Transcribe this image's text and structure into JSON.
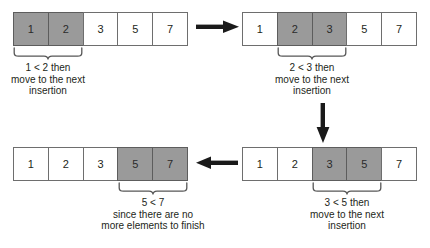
{
  "diagram": {
    "colors": {
      "highlight_fill": "#9a9a9a",
      "cell_fill": "#ffffff",
      "border": "#6e6e6e",
      "text": "#231f20",
      "arrow": "#1a1a1a"
    },
    "steps": [
      {
        "id": "step-1",
        "cells": [
          {
            "value": "1",
            "highlighted": true
          },
          {
            "value": "2",
            "highlighted": true
          },
          {
            "value": "3",
            "highlighted": false
          },
          {
            "value": "5",
            "highlighted": false
          },
          {
            "value": "7",
            "highlighted": false
          }
        ],
        "brace_start_index": 0,
        "brace_end_index": 1,
        "caption": [
          "1 < 2 then",
          "move to the next",
          "insertion"
        ]
      },
      {
        "id": "step-2",
        "cells": [
          {
            "value": "1",
            "highlighted": false
          },
          {
            "value": "2",
            "highlighted": true
          },
          {
            "value": "3",
            "highlighted": true
          },
          {
            "value": "5",
            "highlighted": false
          },
          {
            "value": "7",
            "highlighted": false
          }
        ],
        "brace_start_index": 1,
        "brace_end_index": 2,
        "caption": [
          "2 < 3 then",
          "move to the next",
          "insertion"
        ]
      },
      {
        "id": "step-3",
        "cells": [
          {
            "value": "1",
            "highlighted": false
          },
          {
            "value": "2",
            "highlighted": false
          },
          {
            "value": "3",
            "highlighted": true
          },
          {
            "value": "5",
            "highlighted": true
          },
          {
            "value": "7",
            "highlighted": false
          }
        ],
        "brace_start_index": 2,
        "brace_end_index": 3,
        "caption": [
          "3 < 5 then",
          "move to the next",
          "insertion"
        ]
      },
      {
        "id": "step-4",
        "cells": [
          {
            "value": "1",
            "highlighted": false
          },
          {
            "value": "2",
            "highlighted": false
          },
          {
            "value": "3",
            "highlighted": false
          },
          {
            "value": "5",
            "highlighted": true
          },
          {
            "value": "7",
            "highlighted": true
          }
        ],
        "brace_start_index": 3,
        "brace_end_index": 4,
        "caption": [
          "5 < 7",
          "since there are no",
          "more elements to finish"
        ]
      }
    ],
    "arrows": [
      {
        "id": "arrow-step1-to-step2",
        "direction": "right"
      },
      {
        "id": "arrow-step2-to-step3",
        "direction": "down"
      },
      {
        "id": "arrow-step3-to-step4",
        "direction": "left"
      }
    ]
  },
  "step1": {
    "c0": "1",
    "c1": "2",
    "c2": "3",
    "c3": "5",
    "c4": "7",
    "cap0": "1 < 2 then",
    "cap1": "move to the next",
    "cap2": "insertion"
  },
  "step2": {
    "c0": "1",
    "c1": "2",
    "c2": "3",
    "c3": "5",
    "c4": "7",
    "cap0": "2 < 3 then",
    "cap1": "move to the next",
    "cap2": "insertion"
  },
  "step3": {
    "c0": "1",
    "c1": "2",
    "c2": "3",
    "c3": "5",
    "c4": "7",
    "cap0": "3 < 5 then",
    "cap1": "move to the next",
    "cap2": "insertion"
  },
  "step4": {
    "c0": "1",
    "c1": "2",
    "c2": "3",
    "c3": "5",
    "c4": "7",
    "cap0": "5 < 7",
    "cap1": "since there are no",
    "cap2": "more elements to finish"
  }
}
